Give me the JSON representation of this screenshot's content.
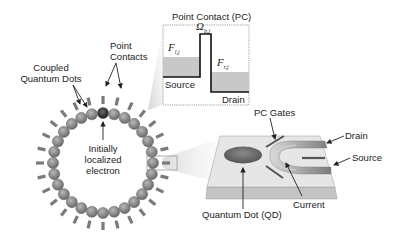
{
  "ring": {
    "dot_count": 28,
    "center": [
      103,
      163
    ],
    "radius": 50,
    "dot_color": "#8a8a8a",
    "highlight_dot_color": "#2a2a2a",
    "gate_color": "#7a7a7a",
    "labels": {
      "coupled_dots": [
        "Coupled",
        "Quantum Dots"
      ],
      "point_contacts": [
        "Point",
        "Contacts"
      ],
      "electron": [
        "Initially",
        "localized",
        "electron"
      ]
    }
  },
  "pc_inset": {
    "title": "Point Contact (PC)",
    "barrier_label": "Ω",
    "barrier_sub": "b,j",
    "left_level_label": "F",
    "left_level_sub": "l,j",
    "right_level_label": "F",
    "right_level_sub": "r,j",
    "source_label": "Source",
    "drain_label": "Drain",
    "fill_color": "#c8c8c8"
  },
  "device": {
    "pc_gates_label": "PC Gates",
    "drain_label": "Drain",
    "source_label": "Source",
    "current_label": "Current",
    "qd_label": "Quantum Dot (QD)"
  }
}
